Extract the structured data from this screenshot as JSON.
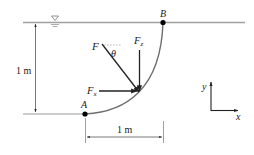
{
  "diagram": {
    "free_surface_symbol": "▽",
    "points": {
      "A": {
        "label": "A"
      },
      "B": {
        "label": "B"
      }
    },
    "forces": {
      "resultant": {
        "label": "F"
      },
      "horizontal": {
        "label": "F",
        "subscript": "x"
      },
      "vertical": {
        "label": "F",
        "subscript": "z"
      },
      "angle": {
        "label": "θ"
      }
    },
    "dimensions": {
      "vertical": {
        "label": "1 m"
      },
      "horizontal": {
        "label": "1 m"
      }
    },
    "axes": {
      "y_label": "y",
      "x_label": "x"
    },
    "colors": {
      "line": "#9a9a9a",
      "curve": "#6e6e6e",
      "arrow": "#222222",
      "point": "#000000"
    }
  }
}
